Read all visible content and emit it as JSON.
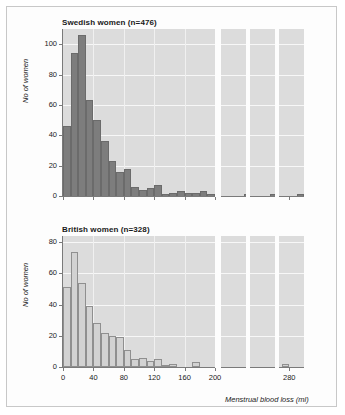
{
  "figure": {
    "xlabel": "Menstrual blood loss (ml)",
    "ylabel": "No of women",
    "background": "#dcdcdc",
    "gridline_color": "#f7f7f7",
    "frame_color": "#c8c8c8"
  },
  "chart_data": [
    {
      "type": "bar",
      "title": "Swedish women (n=476)",
      "xlabel": "Menstrual blood loss (ml)",
      "ylabel": "No of women",
      "n": 476,
      "bar_color": "#7d7d7d",
      "grid": true,
      "legend": "none",
      "bin_width": 10,
      "xlim": [
        0,
        300
      ],
      "ylim": [
        0,
        110
      ],
      "yticks": [
        0,
        20,
        40,
        60,
        80,
        100
      ],
      "xticks": [
        0,
        40,
        80,
        120,
        160,
        200,
        280
      ],
      "axis_break": true,
      "bin_starts": [
        0,
        10,
        20,
        30,
        40,
        50,
        60,
        70,
        80,
        90,
        100,
        110,
        120,
        130,
        140,
        150,
        160,
        170,
        180,
        190,
        230,
        260,
        290
      ],
      "values": [
        46,
        94,
        106,
        63,
        50,
        36,
        23,
        16,
        18,
        6,
        4,
        5,
        7,
        1,
        2,
        3,
        2,
        2,
        3,
        1,
        1,
        1,
        1
      ],
      "categories": [
        "0-10",
        "10-20",
        "20-30",
        "30-40",
        "40-50",
        "50-60",
        "60-70",
        "70-80",
        "80-90",
        "90-100",
        "100-110",
        "110-120",
        "120-130",
        "130-140",
        "140-150",
        "150-160",
        "160-170",
        "170-180",
        "180-190",
        "190-200",
        "230-240",
        "260-270",
        "290-300"
      ]
    },
    {
      "type": "bar",
      "title": "British women (n=328)",
      "xlabel": "Menstrual blood loss (ml)",
      "ylabel": "No of women",
      "n": 328,
      "bar_color": "#d2d2d2",
      "bar_edge_color": "#8f8f8f",
      "grid": true,
      "legend": "none",
      "bin_width": 10,
      "xlim": [
        0,
        300
      ],
      "ylim": [
        0,
        84
      ],
      "yticks": [
        0,
        20,
        40,
        60,
        80
      ],
      "xticks": [
        0,
        40,
        80,
        120,
        160,
        200,
        280
      ],
      "axis_break": true,
      "bin_starts": [
        0,
        10,
        20,
        30,
        40,
        50,
        60,
        70,
        80,
        90,
        100,
        110,
        120,
        130,
        140,
        150,
        170,
        270
      ],
      "values": [
        51,
        74,
        54,
        39,
        28,
        22,
        20,
        19,
        11,
        5,
        6,
        4,
        5,
        1,
        2,
        0,
        3,
        2
      ],
      "categories": [
        "0-10",
        "10-20",
        "20-30",
        "30-40",
        "40-50",
        "50-60",
        "60-70",
        "70-80",
        "80-90",
        "90-100",
        "100-110",
        "110-120",
        "120-130",
        "130-140",
        "140-150",
        "150-160",
        "170-180",
        "270-280"
      ]
    }
  ],
  "panels": {
    "top": {
      "title": "Swedish women (n=476)",
      "ylabel": "No of women",
      "yticks": [
        "100",
        "80",
        "60",
        "40",
        "20",
        "0"
      ]
    },
    "bottom": {
      "title": "British women (n=328)",
      "ylabel": "No of women",
      "yticks": [
        "80",
        "60",
        "40",
        "20",
        "0"
      ],
      "xticks": [
        "0",
        "40",
        "80",
        "120",
        "160",
        "200",
        "280"
      ],
      "xtitle": "Menstrual blood loss (ml)"
    }
  }
}
